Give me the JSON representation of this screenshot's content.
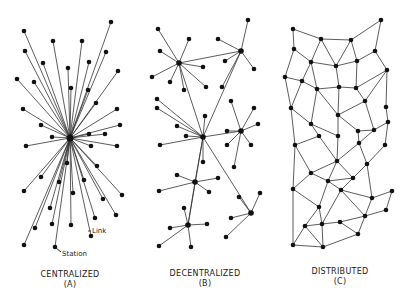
{
  "diagrams": [
    {
      "title": "CENTRALIZED",
      "letter": "(A)"
    },
    {
      "title": "DECENTRALIZED",
      "letter": "(B)"
    },
    {
      "title": "DISTRIBUTED",
      "letter": "(C)"
    }
  ],
  "annotations": {
    "link": "Link",
    "station": "Station"
  },
  "colors": {
    "line": "#333333",
    "node": "#111111",
    "background": "#ffffff"
  },
  "centralized": {
    "center": [
      70,
      138
    ],
    "nodes": [
      [
        24,
        31
      ],
      [
        111,
        22
      ],
      [
        53,
        41
      ],
      [
        82,
        41
      ],
      [
        25,
        51
      ],
      [
        106,
        52
      ],
      [
        43,
        63
      ],
      [
        89,
        62
      ],
      [
        68,
        68
      ],
      [
        118,
        71
      ],
      [
        17,
        79
      ],
      [
        34,
        82
      ],
      [
        71,
        88
      ],
      [
        88,
        90
      ],
      [
        96,
        103
      ],
      [
        23,
        109
      ],
      [
        117,
        109
      ],
      [
        41,
        125
      ],
      [
        120,
        125
      ],
      [
        52,
        137
      ],
      [
        89,
        134
      ],
      [
        105,
        134
      ],
      [
        26,
        146
      ],
      [
        91,
        146
      ],
      [
        117,
        146
      ],
      [
        67,
        163
      ],
      [
        97,
        166
      ],
      [
        41,
        177
      ],
      [
        59,
        182
      ],
      [
        84,
        180
      ],
      [
        24,
        191
      ],
      [
        73,
        193
      ],
      [
        122,
        195
      ],
      [
        103,
        199
      ],
      [
        50,
        208
      ],
      [
        116,
        215
      ],
      [
        95,
        218
      ],
      [
        35,
        228
      ],
      [
        52,
        224
      ],
      [
        71,
        225
      ],
      [
        91,
        236
      ],
      [
        24,
        245
      ],
      [
        55,
        247
      ]
    ]
  },
  "decentralized": {
    "hubs": [
      [
        179,
        63
      ],
      [
        241,
        51
      ],
      [
        203,
        137
      ],
      [
        241,
        131
      ],
      [
        195,
        182
      ],
      [
        251,
        213
      ],
      [
        188,
        225
      ]
    ],
    "hub_links": [
      [
        0,
        1
      ],
      [
        0,
        2
      ],
      [
        1,
        2
      ],
      [
        2,
        3
      ],
      [
        2,
        4
      ],
      [
        2,
        5
      ],
      [
        2,
        6
      ],
      [
        4,
        6
      ]
    ],
    "spokes": [
      [
        0,
        [
          [
            158,
            29
          ],
          [
            189,
            39
          ],
          [
            160,
            51
          ],
          [
            203,
            67
          ],
          [
            152,
            77
          ],
          [
            170,
            82
          ],
          [
            184,
            90
          ],
          [
            206,
            87
          ]
        ]
      ],
      [
        1,
        [
          [
            248,
            20
          ],
          [
            218,
            39
          ],
          [
            225,
            61
          ],
          [
            254,
            69
          ],
          [
            222,
            87
          ]
        ]
      ],
      [
        2,
        [
          [
            157,
            99
          ],
          [
            157,
            108
          ],
          [
            205,
            116
          ],
          [
            177,
            126
          ],
          [
            186,
            136
          ],
          [
            160,
            145
          ],
          [
            203,
            162
          ]
        ]
      ],
      [
        3,
        [
          [
            231,
            101
          ],
          [
            254,
            108
          ],
          [
            258,
            124
          ],
          [
            227,
            131
          ],
          [
            227,
            145
          ],
          [
            251,
            145
          ],
          [
            234,
            167
          ]
        ]
      ],
      [
        4,
        [
          [
            177,
            175
          ],
          [
            218,
            178
          ],
          [
            159,
            191
          ],
          [
            209,
            192
          ]
        ]
      ],
      [
        5,
        [
          [
            239,
            197
          ],
          [
            260,
            193
          ],
          [
            231,
            218
          ],
          [
            226,
            237
          ]
        ]
      ],
      [
        6,
        [
          [
            184,
            208
          ],
          [
            170,
            228
          ],
          [
            207,
            224
          ],
          [
            159,
            246
          ],
          [
            191,
            247
          ]
        ]
      ]
    ]
  },
  "distributed": {
    "nodes": {
      "a": [
        293,
        29
      ],
      "b": [
        321,
        39
      ],
      "c": [
        351,
        40
      ],
      "d": [
        381,
        20
      ],
      "e": [
        294,
        49
      ],
      "f": [
        311,
        62
      ],
      "g": [
        336,
        66
      ],
      "h": [
        357,
        61
      ],
      "i": [
        375,
        51
      ],
      "j": [
        285,
        77
      ],
      "k": [
        302,
        81
      ],
      "l": [
        317,
        89
      ],
      "m": [
        339,
        87
      ],
      "n": [
        356,
        88
      ],
      "o": [
        387,
        70
      ],
      "r": [
        291,
        108
      ],
      "q": [
        365,
        101
      ],
      "s": [
        338,
        115
      ],
      "u": [
        311,
        124
      ],
      "t": [
        386,
        107
      ],
      "v": [
        388,
        122
      ],
      "w": [
        319,
        136
      ],
      "x": [
        338,
        136
      ],
      "y": [
        358,
        131
      ],
      "z": [
        374,
        130
      ],
      "A": [
        295,
        145
      ],
      "B": [
        359,
        143
      ],
      "C": [
        385,
        145
      ],
      "D": [
        337,
        161
      ],
      "E": [
        367,
        164
      ],
      "F": [
        311,
        173
      ],
      "G": [
        328,
        181
      ],
      "H": [
        353,
        178
      ],
      "I": [
        293,
        189
      ],
      "J": [
        341,
        190
      ],
      "K": [
        392,
        191
      ],
      "L": [
        372,
        198
      ],
      "M": [
        386,
        210
      ],
      "N": [
        319,
        207
      ],
      "O": [
        365,
        216
      ],
      "P": [
        305,
        226
      ],
      "Q": [
        322,
        224
      ],
      "R": [
        340,
        222
      ],
      "S": [
        358,
        234
      ],
      "T": [
        293,
        245
      ],
      "U": [
        323,
        247
      ]
    },
    "edges": [
      [
        "a",
        "b"
      ],
      [
        "b",
        "c"
      ],
      [
        "c",
        "d"
      ],
      [
        "a",
        "e"
      ],
      [
        "b",
        "f"
      ],
      [
        "b",
        "g"
      ],
      [
        "c",
        "g"
      ],
      [
        "c",
        "h"
      ],
      [
        "d",
        "i"
      ],
      [
        "e",
        "f"
      ],
      [
        "e",
        "j"
      ],
      [
        "f",
        "g"
      ],
      [
        "g",
        "h"
      ],
      [
        "h",
        "i"
      ],
      [
        "i",
        "o"
      ],
      [
        "f",
        "k"
      ],
      [
        "f",
        "l"
      ],
      [
        "j",
        "k"
      ],
      [
        "k",
        "l"
      ],
      [
        "l",
        "m"
      ],
      [
        "m",
        "n"
      ],
      [
        "g",
        "m"
      ],
      [
        "h",
        "n"
      ],
      [
        "n",
        "o"
      ],
      [
        "o",
        "q"
      ],
      [
        "o",
        "t"
      ],
      [
        "j",
        "r"
      ],
      [
        "k",
        "r"
      ],
      [
        "l",
        "u"
      ],
      [
        "r",
        "u"
      ],
      [
        "m",
        "s"
      ],
      [
        "l",
        "s"
      ],
      [
        "n",
        "q"
      ],
      [
        "q",
        "s"
      ],
      [
        "q",
        "z"
      ],
      [
        "t",
        "v"
      ],
      [
        "s",
        "x"
      ],
      [
        "s",
        "y"
      ],
      [
        "u",
        "w"
      ],
      [
        "u",
        "x"
      ],
      [
        "r",
        "A"
      ],
      [
        "w",
        "A"
      ],
      [
        "x",
        "D"
      ],
      [
        "w",
        "D"
      ],
      [
        "y",
        "z"
      ],
      [
        "y",
        "B"
      ],
      [
        "z",
        "v"
      ],
      [
        "z",
        "B"
      ],
      [
        "B",
        "D"
      ],
      [
        "B",
        "E"
      ],
      [
        "v",
        "C"
      ],
      [
        "C",
        "E"
      ],
      [
        "A",
        "F"
      ],
      [
        "D",
        "F"
      ],
      [
        "D",
        "G"
      ],
      [
        "D",
        "H"
      ],
      [
        "F",
        "G"
      ],
      [
        "G",
        "H"
      ],
      [
        "H",
        "E"
      ],
      [
        "H",
        "J"
      ],
      [
        "E",
        "L"
      ],
      [
        "G",
        "J"
      ],
      [
        "F",
        "I"
      ],
      [
        "A",
        "I"
      ],
      [
        "I",
        "N"
      ],
      [
        "I",
        "T"
      ],
      [
        "G",
        "N"
      ],
      [
        "J",
        "L"
      ],
      [
        "J",
        "O"
      ],
      [
        "L",
        "K"
      ],
      [
        "L",
        "O"
      ],
      [
        "K",
        "M"
      ],
      [
        "M",
        "O"
      ],
      [
        "N",
        "P"
      ],
      [
        "N",
        "Q"
      ],
      [
        "J",
        "Q"
      ],
      [
        "Q",
        "R"
      ],
      [
        "R",
        "O"
      ],
      [
        "R",
        "S"
      ],
      [
        "O",
        "S"
      ],
      [
        "P",
        "Q"
      ],
      [
        "P",
        "T"
      ],
      [
        "T",
        "U"
      ],
      [
        "Q",
        "U"
      ],
      [
        "S",
        "U"
      ],
      [
        "P",
        "U"
      ]
    ]
  }
}
